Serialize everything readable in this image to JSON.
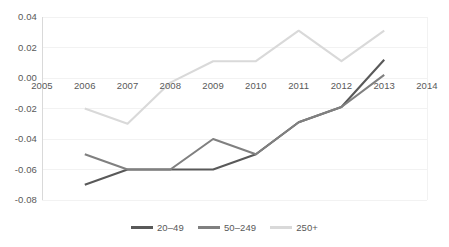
{
  "chart_data": {
    "type": "line",
    "title": "",
    "subtitle": "",
    "xlabel": "",
    "ylabel": "",
    "x": [
      2006,
      2007,
      2008,
      2009,
      2010,
      2011,
      2012,
      2013
    ],
    "xlim": [
      2005,
      2014
    ],
    "ylim": [
      -0.08,
      0.04
    ],
    "grid": true,
    "grid_axis": "y",
    "legend_position": "bottom-center",
    "x_tick_labels": [
      "2005",
      "2006",
      "2007",
      "2008",
      "2009",
      "2010",
      "2011",
      "2012",
      "2013",
      "2014"
    ],
    "x_tick_values": [
      2005,
      2006,
      2007,
      2008,
      2009,
      2010,
      2011,
      2012,
      2013,
      2014
    ],
    "y_tick_labels": [
      "0.04",
      "0.02",
      "0.00",
      "-0.02",
      "-0.04",
      "-0.06",
      "-0.08"
    ],
    "y_tick_values": [
      0.04,
      0.02,
      0.0,
      -0.02,
      -0.04,
      -0.06,
      -0.08
    ],
    "series": [
      {
        "name": "20–49",
        "color": "#595959",
        "values": [
          -0.07,
          -0.06,
          -0.06,
          -0.06,
          -0.05,
          -0.029,
          -0.019,
          0.012
        ]
      },
      {
        "name": "50–249",
        "color": "#808080",
        "values": [
          -0.05,
          -0.06,
          -0.06,
          -0.04,
          -0.05,
          -0.029,
          -0.019,
          0.002
        ]
      },
      {
        "name": "250+",
        "color": "#d9d9d9",
        "values": [
          -0.02,
          -0.03,
          -0.003,
          0.011,
          0.011,
          0.031,
          0.011,
          0.031
        ]
      }
    ]
  },
  "legend": {
    "items": [
      {
        "label": "20–49",
        "color": "#595959"
      },
      {
        "label": "50–249",
        "color": "#808080"
      },
      {
        "label": "250+",
        "color": "#d9d9d9"
      }
    ]
  },
  "colors": {
    "axis_line": "#d9d9d9",
    "gridline": "#f2f2f2",
    "tick_text": "#595959",
    "plot_background": "#ffffff"
  }
}
